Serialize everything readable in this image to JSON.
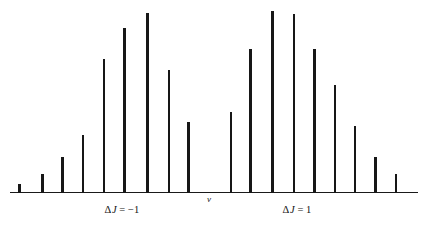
{
  "figure": {
    "title": "",
    "axis_symbol": "ν",
    "left_branch_label": {
      "delta": "Δ",
      "variable": "J",
      "equals": "=",
      "value": "−1",
      "full": "ΔJ = −1"
    },
    "right_branch_label": {
      "delta": "Δ",
      "variable": "J",
      "equals": "=",
      "value": "1",
      "full": "ΔJ = 1"
    }
  },
  "chart_data": {
    "type": "bar",
    "title": "",
    "subtitle": "",
    "xlabel": "ν",
    "ylabel": "",
    "grid": false,
    "legend": null,
    "axis": {
      "x_start_px": 10,
      "x_end_px": 418,
      "baseline_px": 192.5,
      "x_tick_labels": [],
      "y_tick_labels": [],
      "xlim": null,
      "ylim": [
        0,
        1
      ]
    },
    "branches": [
      {
        "name": "ΔJ = −1",
        "label": "ΔJ = −1",
        "label_x_px": 122,
        "side": "left",
        "categories": [
          "P9",
          "P8",
          "P7",
          "P6",
          "P5",
          "P4",
          "P3",
          "P2",
          "P1"
        ],
        "x_px": [
          19.5,
          42.5,
          62.5,
          83.0,
          104.0,
          124.5,
          147.5,
          169.0,
          188.5
        ],
        "top_px": [
          183.5,
          174.0,
          156.5,
          135.0,
          58.5,
          28.0,
          12.5,
          69.5,
          121.5
        ],
        "values": [
          0.05,
          0.1,
          0.2,
          0.32,
          0.74,
          0.91,
          1.0,
          0.68,
          0.39
        ]
      },
      {
        "name": "ΔJ = 1",
        "label": "ΔJ = 1",
        "label_x_px": 297,
        "side": "right",
        "categories": [
          "R0",
          "R1",
          "R2",
          "R3",
          "R4",
          "R5",
          "R6",
          "R7",
          "R8"
        ],
        "x_px": [
          231.0,
          250.5,
          272.5,
          294.0,
          314.5,
          335.0,
          355.0,
          375.5,
          396.0
        ],
        "top_px": [
          111.5,
          48.5,
          11.0,
          13.5,
          48.5,
          84.5,
          126.0,
          156.5,
          174.0
        ],
        "values": [
          0.45,
          0.8,
          1.01,
          0.99,
          0.8,
          0.6,
          0.37,
          0.2,
          0.1
        ]
      }
    ],
    "annotations": [
      {
        "text": "ν",
        "x_px": 209,
        "y_px": 202,
        "role": "band-origin-marker"
      },
      {
        "text": "ΔJ = −1",
        "x_px": 122,
        "y_px": 212,
        "role": "p-branch-label"
      },
      {
        "text": "ΔJ = 1",
        "x_px": 297,
        "y_px": 212,
        "role": "r-branch-label"
      }
    ]
  }
}
